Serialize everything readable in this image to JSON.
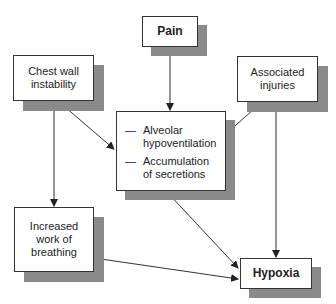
{
  "diagram": {
    "nodes": {
      "chest_wall": {
        "label": "Chest wall\ninstability",
        "line1": "Chest wall",
        "line2": "instability"
      },
      "pain": {
        "label": "Pain"
      },
      "associated": {
        "label": "Associated injuries",
        "line1": "Associated",
        "line2": "injuries"
      },
      "central": {
        "items": [
          {
            "dash": "—",
            "line1": "Alveolar",
            "line2": "hypoventilation"
          },
          {
            "dash": "—",
            "line1": "Accumulation",
            "line2": "of secretions"
          }
        ]
      },
      "work": {
        "line1": "Increased",
        "line2": "work of",
        "line3": "breathing"
      },
      "hypoxia": {
        "label": "Hypoxia"
      }
    },
    "edges": [
      {
        "from": "Pain",
        "to": "Alveolar hypoventilation / Accumulation of secretions"
      },
      {
        "from": "Chest wall instability",
        "to": "Alveolar hypoventilation / Accumulation of secretions"
      },
      {
        "from": "Associated injuries",
        "to": "Alveolar hypoventilation / Accumulation of secretions"
      },
      {
        "from": "Chest wall instability",
        "to": "Increased work of breathing"
      },
      {
        "from": "Associated injuries",
        "to": "Hypoxia"
      },
      {
        "from": "Alveolar hypoventilation / Accumulation of secretions",
        "to": "Hypoxia"
      },
      {
        "from": "Increased work of breathing",
        "to": "Hypoxia"
      }
    ],
    "colors": {
      "border": "#333333",
      "shadow": "#8a8a8a",
      "arrow": "#222222"
    }
  }
}
